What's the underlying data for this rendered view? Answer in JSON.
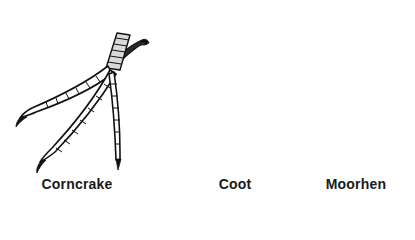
{
  "figure": {
    "panels": [
      {
        "id": "corncrake",
        "label": "Corncrake",
        "foot_type": "slender unwebbed toes"
      },
      {
        "id": "coot",
        "label": "Coot",
        "foot_type": "lobed toes"
      },
      {
        "id": "moorhen",
        "label": "Moorhen",
        "foot_type": "long unwebbed toes with fringe"
      }
    ]
  },
  "colors": {
    "ink": "#111111",
    "background": "#ffffff"
  }
}
